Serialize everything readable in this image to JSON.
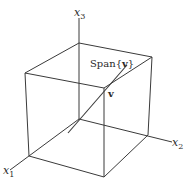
{
  "figure": {
    "type": "3d-axes-with-box",
    "axes": {
      "x1": {
        "label": "x",
        "subscript": "1"
      },
      "x2": {
        "label": "x",
        "subscript": "2"
      },
      "x3": {
        "label": "x",
        "subscript": "3"
      }
    },
    "span_label": "Span{v}",
    "span_label_parts": {
      "prefix": "Span",
      "open": "{",
      "vec": "v",
      "close": "}"
    },
    "vector_label": "v",
    "colors": {
      "line": "#3a3a3a",
      "text": "#2a2a2a",
      "background": "#ffffff"
    }
  }
}
